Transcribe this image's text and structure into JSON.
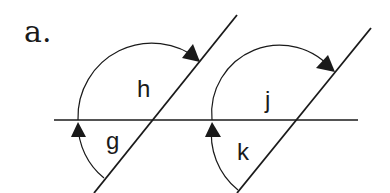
{
  "figure": {
    "part_label": "a.",
    "angle_labels": {
      "h": "h",
      "g": "g",
      "j": "j",
      "k": "k"
    },
    "colors": {
      "stroke": "#1a1a1a",
      "background": "#ffffff"
    }
  }
}
